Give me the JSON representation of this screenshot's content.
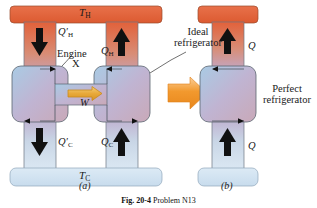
{
  "figure": {
    "caption_prefix": "Fig. 20-4",
    "caption_text": "Problem N13",
    "panels": [
      {
        "id": "a",
        "label": "(a)"
      },
      {
        "id": "b",
        "label": "(b)"
      }
    ]
  },
  "reservoirs": {
    "hot": {
      "label": "T",
      "subscript": "H",
      "color": "#e2613a"
    },
    "cold": {
      "label": "T",
      "subscript": "C",
      "color": "#cfe0ee"
    }
  },
  "panel_a": {
    "engine_label": "Engine",
    "engine_name": "X",
    "work_label": "W",
    "ideal_refrigerator_label_line1": "Ideal",
    "ideal_refrigerator_label_line2": "refrigerator",
    "heat_flows": [
      {
        "name": "q-prime-h",
        "symbol": "Q",
        "prime": "′",
        "subscript": "H",
        "direction": "down"
      },
      {
        "name": "q-h",
        "symbol": "Q",
        "prime": "",
        "subscript": "H",
        "direction": "up"
      },
      {
        "name": "q-prime-c",
        "symbol": "Q",
        "prime": "′",
        "subscript": "C",
        "direction": "down"
      },
      {
        "name": "q-c",
        "symbol": "Q",
        "prime": "",
        "subscript": "C",
        "direction": "up"
      }
    ]
  },
  "panel_b": {
    "perfect_refrigerator_label_line1": "Perfect",
    "perfect_refrigerator_label_line2": "refrigerator",
    "heat_flows": [
      {
        "name": "q-top",
        "symbol": "Q",
        "direction": "up"
      },
      {
        "name": "q-bottom",
        "symbol": "Q",
        "direction": "up"
      }
    ]
  },
  "colors": {
    "hot_orange": "#e2613a",
    "cold_blue": "#cfe0ee",
    "box_blue": "#b9d3e8",
    "arrow_gold": "#e8a93a",
    "transition_arrow": "#f09a30",
    "stroke": "#5a6470",
    "text": "#1a1a1a"
  }
}
